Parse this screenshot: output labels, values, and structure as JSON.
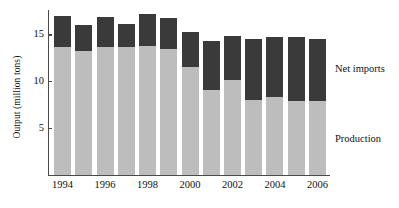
{
  "chart_data": {
    "type": "bar",
    "stacked": true,
    "title": "",
    "subtitle": "",
    "xlabel": "",
    "ylabel": "Output (million tons)",
    "x": [
      1994,
      1995,
      1996,
      1997,
      1998,
      1999,
      2000,
      2001,
      2002,
      2003,
      2004,
      2005,
      2006
    ],
    "categories": [
      "1994",
      "1995",
      "1996",
      "1997",
      "1998",
      "1999",
      "2000",
      "2001",
      "2002",
      "2003",
      "2004",
      "2005",
      "2006"
    ],
    "visible_xtick_labels": [
      "1994",
      "1996",
      "1998",
      "2000",
      "2002",
      "2004",
      "2006"
    ],
    "series": [
      {
        "name": "Production",
        "color": "#bdbdbd",
        "values": [
          13.6,
          13.2,
          13.6,
          13.6,
          13.8,
          13.4,
          11.5,
          9.1,
          10.1,
          8.0,
          8.3,
          7.9,
          7.9
        ]
      },
      {
        "name": "Net imports",
        "color": "#3a3a3a",
        "values": [
          3.4,
          2.8,
          3.3,
          2.5,
          3.4,
          3.4,
          3.7,
          5.2,
          4.7,
          6.5,
          6.4,
          6.8,
          6.6
        ]
      }
    ],
    "totals": [
      17.0,
      16.0,
      16.9,
      16.1,
      17.2,
      16.8,
      15.2,
      14.3,
      14.8,
      14.5,
      14.7,
      14.7,
      14.5
    ],
    "yticks": [
      5,
      10,
      15
    ],
    "ytick_labels": [
      "5",
      "10",
      "15"
    ],
    "ylim": [
      0,
      17.6
    ],
    "xlim": [
      1993.5,
      2006.5
    ],
    "grid": false,
    "legend_position": "right-inline",
    "legend_entries": [
      "Net imports",
      "Production"
    ]
  },
  "axes": {
    "y_title": "Output (million tons)",
    "y_tick_labels": [
      "15",
      "10",
      "5"
    ],
    "x_tick_labels": [
      "1994",
      "1996",
      "1998",
      "2000",
      "2002",
      "2004",
      "2006"
    ]
  },
  "legend": {
    "net_imports": "Net imports",
    "production": "Production"
  },
  "colors": {
    "production": "#bdbdbd",
    "net_imports": "#3a3a3a",
    "axis": "#4a4a4a",
    "text": "#111111",
    "background": "#ffffff"
  }
}
